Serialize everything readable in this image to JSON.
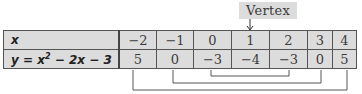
{
  "annotation": {
    "label": "Vertex",
    "points_to_x": "1"
  },
  "table": {
    "row_headers": {
      "x": "x",
      "y_prefix": "y = x",
      "y_exp": "2",
      "y_suffix": " − 2x − 3"
    },
    "x_values": [
      "−2",
      "−1",
      "0",
      "1",
      "2",
      "3",
      "4"
    ],
    "y_values": [
      "5",
      "0",
      "−3",
      "−4",
      "−3",
      "0",
      "5"
    ]
  },
  "symmetry_pairs": [
    {
      "left_x": "0",
      "right_x": "2",
      "y": "−3"
    },
    {
      "left_x": "−1",
      "right_x": "3",
      "y": "0"
    },
    {
      "left_x": "−2",
      "right_x": "4",
      "y": "5"
    }
  ],
  "colors": {
    "cell_fill": "#dcdcdc",
    "border": "#555555",
    "bracket": "#555555"
  }
}
